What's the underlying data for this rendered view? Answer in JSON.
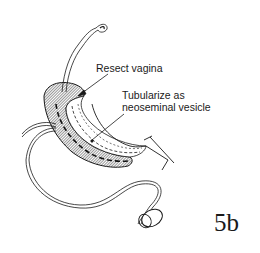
{
  "figure": {
    "number": "5b",
    "annotations": [
      {
        "id": "resect",
        "text": "Resect vagina"
      },
      {
        "id": "tubular",
        "text": "Tubularize as\nneoseminal vesicle"
      }
    ],
    "colors": {
      "ink": "#1a1a1a",
      "background": "#ffffff"
    }
  }
}
